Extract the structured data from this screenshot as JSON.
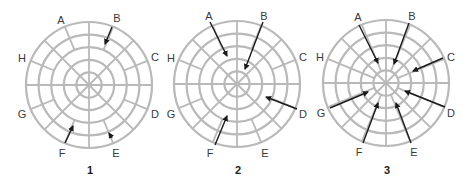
{
  "figure": {
    "ring_color": "#b9b9b9",
    "arrow_color": "#1a1a1a",
    "diagrams": [
      {
        "number": "1",
        "center": [
          89,
          85
        ],
        "radius": 63,
        "rings": 5,
        "inner_spoke_start_ring": 3,
        "labels": [
          {
            "text": "A",
            "x": 61,
            "y": 24
          },
          {
            "text": "B",
            "x": 117,
            "y": 22
          },
          {
            "text": "C",
            "x": 155,
            "y": 61
          },
          {
            "text": "D",
            "x": 155,
            "y": 118
          },
          {
            "text": "E",
            "x": 116,
            "y": 157
          },
          {
            "text": "F",
            "x": 62,
            "y": 157
          },
          {
            "text": "G",
            "x": 22,
            "y": 118
          },
          {
            "text": "H",
            "x": 22,
            "y": 62
          }
        ],
        "arrows": [
          {
            "target": "B",
            "from": [
              112,
              27
            ],
            "to": [
              105,
              44
            ]
          },
          {
            "target": "F",
            "from": [
              65,
              143
            ],
            "to": [
              73,
              126
            ]
          },
          {
            "target": "E",
            "from": [
              112,
              138
            ],
            "to": [
              109,
              133
            ]
          }
        ]
      },
      {
        "number": "2",
        "center": [
          237,
          84
        ],
        "radius": 63,
        "rings": 5,
        "inner_spoke_start_ring": 3,
        "labels": [
          {
            "text": "A",
            "x": 209,
            "y": 20
          },
          {
            "text": "B",
            "x": 264,
            "y": 20
          },
          {
            "text": "C",
            "x": 303,
            "y": 61
          },
          {
            "text": "D",
            "x": 303,
            "y": 118
          },
          {
            "text": "E",
            "x": 265,
            "y": 157
          },
          {
            "text": "F",
            "x": 210,
            "y": 157
          },
          {
            "text": "G",
            "x": 171,
            "y": 118
          },
          {
            "text": "H",
            "x": 171,
            "y": 62
          }
        ],
        "arrows": [
          {
            "target": "A",
            "from": [
              210,
              22
            ],
            "to": [
              227,
              56
            ]
          },
          {
            "target": "B",
            "from": [
              263,
              22
            ],
            "to": [
              245,
              69
            ]
          },
          {
            "target": "D",
            "from": [
              297,
              109
            ],
            "to": [
              266,
              97
            ]
          },
          {
            "target": "F",
            "from": [
              215,
              145
            ],
            "to": [
              227,
              116
            ]
          }
        ]
      },
      {
        "number": "3",
        "center": [
          386,
          83
        ],
        "radius": 63,
        "rings": 5,
        "inner_spoke_start_ring": 1,
        "labels": [
          {
            "text": "A",
            "x": 358,
            "y": 21
          },
          {
            "text": "B",
            "x": 412,
            "y": 20
          },
          {
            "text": "C",
            "x": 451,
            "y": 61
          },
          {
            "text": "D",
            "x": 451,
            "y": 117
          },
          {
            "text": "E",
            "x": 414,
            "y": 156
          },
          {
            "text": "F",
            "x": 359,
            "y": 156
          },
          {
            "text": "G",
            "x": 321,
            "y": 117
          },
          {
            "text": "H",
            "x": 320,
            "y": 61
          }
        ],
        "arrows": [
          {
            "target": "A",
            "from": [
              359,
              25
            ],
            "to": [
              378,
              63
            ]
          },
          {
            "target": "B",
            "from": [
              409,
              23
            ],
            "to": [
              394,
              64
            ]
          },
          {
            "target": "C",
            "from": [
              443,
              58
            ],
            "to": [
              413,
              71
            ]
          },
          {
            "target": "D",
            "from": [
              445,
              107
            ],
            "to": [
              405,
              91
            ]
          },
          {
            "target": "E",
            "from": [
              411,
              143
            ],
            "to": [
              396,
              103
            ]
          },
          {
            "target": "F",
            "from": [
              363,
              143
            ],
            "to": [
              378,
              103
            ]
          },
          {
            "target": "G",
            "from": [
              330,
              108
            ],
            "to": [
              368,
              92
            ]
          }
        ]
      }
    ],
    "numbers_y": 174
  }
}
